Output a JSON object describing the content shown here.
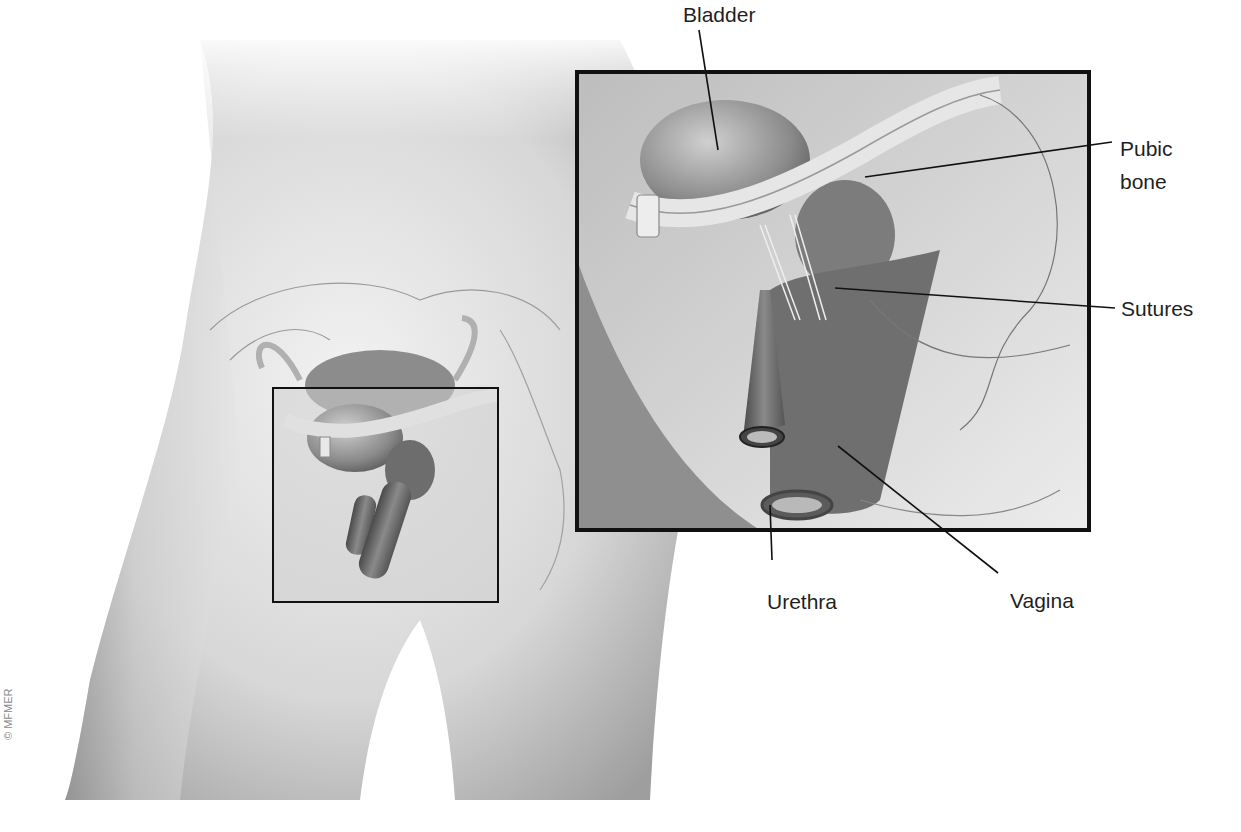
{
  "figure": {
    "labels": {
      "bladder": "Bladder",
      "pubic_bone_line1": "Pubic",
      "pubic_bone_line2": "bone",
      "sutures": "Sutures",
      "urethra": "Urethra",
      "vagina": "Vagina"
    },
    "copyright": "© MFMER"
  },
  "colors": {
    "background": "#ffffff",
    "body_tone_dark": "#9a9a9a",
    "body_tone_light": "#e6e6e6",
    "inset_border": "#111111",
    "leader_line": "#111111",
    "label_text": "#1f1f1f"
  },
  "inset": {
    "small_box": {
      "x": 273,
      "y": 388,
      "w": 225,
      "h": 214
    },
    "large_box": {
      "x": 577,
      "y": 72,
      "w": 512,
      "h": 458
    }
  }
}
